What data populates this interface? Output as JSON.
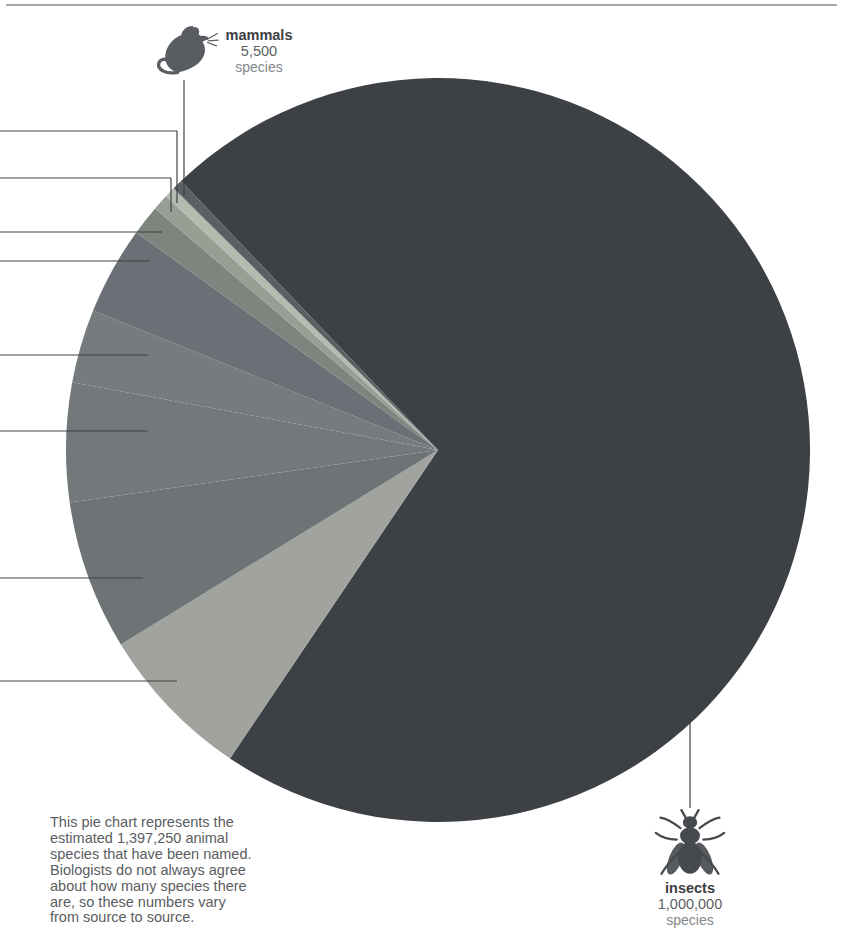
{
  "page": {
    "background_color": "#ffffff",
    "top_rule_color": "#a2a7aa"
  },
  "icons": [
    "mouse-icon",
    "fly-icon"
  ],
  "callouts": {
    "mammals": {
      "name": "mammals",
      "value": "5,500",
      "unit": "species"
    },
    "insects": {
      "name": "insects",
      "value": "1,000,000",
      "unit": "species"
    }
  },
  "caption": {
    "lines": [
      "This pie chart represents the",
      "estimated 1,397,250 animal",
      "species that have been named.",
      "Biologists do not always agree",
      "about how many species there",
      "are, so these numbers vary",
      "from source to source."
    ]
  },
  "chart_data": {
    "type": "pie",
    "title": "",
    "total_named_animal_species": "1,397,250",
    "legend": "none; two slices labeled with leader lines, remaining leader-line labels cropped off the left edge of the frame",
    "slices": [
      {
        "id": "insects",
        "label": "insects",
        "species": "1,000,000",
        "percent_est": 71.6,
        "degrees": 257.7,
        "color": "#3d4145"
      },
      {
        "id": "unlabeled-1",
        "label": "",
        "label_cropped": true,
        "percent_est": 6.8,
        "degrees": 24.5,
        "color": "#a0a39e"
      },
      {
        "id": "unlabeled-2",
        "label": "",
        "label_cropped": true,
        "percent_est": 6.5,
        "degrees": 23.4,
        "color": "#6e7375"
      },
      {
        "id": "unlabeled-3",
        "label": "",
        "label_cropped": true,
        "percent_est": 5.2,
        "degrees": 18.6,
        "color": "#73787b"
      },
      {
        "id": "unlabeled-4",
        "label": "",
        "label_cropped": true,
        "percent_est": 3.2,
        "degrees": 11.5,
        "color": "#767b7d"
      },
      {
        "id": "unlabeled-5",
        "label": "",
        "label_cropped": true,
        "percent_est": 3.8,
        "degrees": 13.8,
        "color": "#6b7076"
      },
      {
        "id": "unlabeled-6",
        "label": "",
        "label_cropped": true,
        "percent_est": 1.3,
        "degrees": 4.7,
        "color": "#7e857f"
      },
      {
        "id": "unlabeled-7",
        "label": "",
        "label_cropped": true,
        "percent_est": 0.7,
        "degrees": 2.5,
        "color": "#989e94"
      },
      {
        "id": "unlabeled-8",
        "label": "",
        "label_cropped": true,
        "percent_est": 0.5,
        "degrees": 1.7,
        "color": "#b5bab0"
      },
      {
        "id": "mammals",
        "label": "mammals",
        "species": "5,500",
        "percent_est": 0.4,
        "degrees": 1.6,
        "color": "#5b5f62"
      }
    ],
    "layout": {
      "cx": 438,
      "cy": 450,
      "r": 372,
      "start_angle_deg_clockwise_from_12": 316.3,
      "leader_line_color": "#3f4245",
      "leader_lines": [
        {
          "x1": 0,
          "y1": 131,
          "x2": 177,
          "y2": 131
        },
        {
          "x1": 177,
          "y1": 131,
          "x2": 177,
          "y2": 203
        },
        {
          "x1": 0,
          "y1": 178,
          "x2": 171,
          "y2": 178
        },
        {
          "x1": 171,
          "y1": 178,
          "x2": 171,
          "y2": 212
        },
        {
          "x1": 0,
          "y1": 232,
          "x2": 162,
          "y2": 232
        },
        {
          "x1": 0,
          "y1": 261,
          "x2": 150,
          "y2": 261
        },
        {
          "x1": 0,
          "y1": 355,
          "x2": 148,
          "y2": 355
        },
        {
          "x1": 0,
          "y1": 431,
          "x2": 148,
          "y2": 431
        },
        {
          "x1": 0,
          "y1": 578,
          "x2": 143,
          "y2": 578
        },
        {
          "x1": 0,
          "y1": 681,
          "x2": 177,
          "y2": 681
        },
        {
          "x1": 184,
          "y1": 80,
          "x2": 184,
          "y2": 196
        },
        {
          "x1": 690,
          "y1": 700,
          "x2": 690,
          "y2": 808
        }
      ]
    }
  }
}
